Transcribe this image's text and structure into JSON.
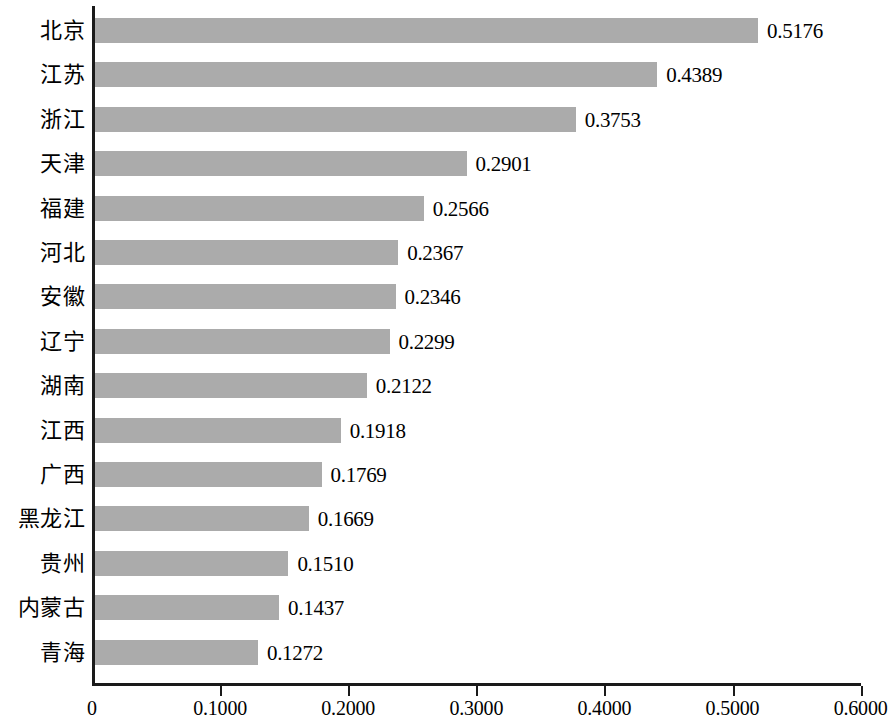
{
  "chart_data": {
    "type": "bar",
    "orientation": "horizontal",
    "title": "",
    "subtitle": "",
    "xlabel": "",
    "ylabel": "",
    "xlim": [
      0,
      0.6
    ],
    "grid": false,
    "legend": null,
    "bar_color": "#ababab",
    "axis_color": "#1a1a1a",
    "value_label_format": "0.0000",
    "xticks": [
      0,
      0.1,
      0.2,
      0.3,
      0.4,
      0.5,
      0.6
    ],
    "xtick_labels": [
      "0",
      "0.1000",
      "0.2000",
      "0.3000",
      "0.4000",
      "0.5000",
      "0.6000"
    ],
    "categories": [
      "北京",
      "江苏",
      "浙江",
      "天津",
      "福建",
      "河北",
      "安徽",
      "辽宁",
      "湖南",
      "江西",
      "广西",
      "黑龙江",
      "贵州",
      "内蒙古",
      "青海"
    ],
    "values": [
      0.5176,
      0.4389,
      0.3753,
      0.2901,
      0.2566,
      0.2367,
      0.2346,
      0.2299,
      0.2122,
      0.1918,
      0.1769,
      0.1669,
      0.151,
      0.1437,
      0.1272
    ],
    "value_labels": [
      "0.5176",
      "0.4389",
      "0.3753",
      "0.2901",
      "0.2566",
      "0.2367",
      "0.2346",
      "0.2299",
      "0.2122",
      "0.1918",
      "0.1769",
      "0.1669",
      "0.1510",
      "0.1437",
      "0.1272"
    ]
  }
}
